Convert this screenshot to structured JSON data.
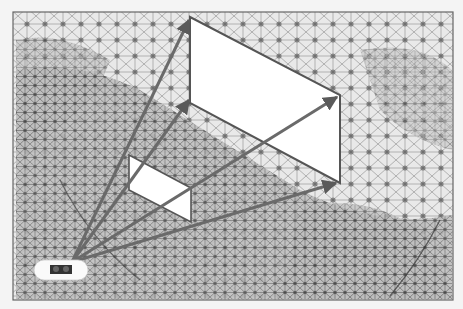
{
  "figure": {
    "colors": {
      "background": "#f4f4f4",
      "frame_border": "#666666",
      "mesh_line": "#8a8a8a",
      "mesh_dense": "#3a3a3a",
      "plane_fill": "#ffffff",
      "plane_edge": "#555555",
      "ray": "#6a6a6a",
      "camera_body": "#fafafa",
      "camera_lens": "#333333"
    },
    "frame": {
      "x": 13,
      "y": 12,
      "w": 440,
      "h": 288
    },
    "camera": {
      "x": 72,
      "y": 262,
      "label": "camera-icon"
    },
    "large_plane": {
      "points": [
        [
          190,
          17
        ],
        [
          340,
          95
        ],
        [
          340,
          183
        ],
        [
          190,
          103
        ]
      ]
    },
    "small_plane": {
      "points": [
        [
          129,
          155
        ],
        [
          191,
          188
        ],
        [
          191,
          222
        ],
        [
          129,
          190
        ]
      ]
    },
    "rays": [
      {
        "to": [
          190,
          17
        ]
      },
      {
        "to": [
          340,
          95
        ]
      },
      {
        "to": [
          340,
          183
        ]
      },
      {
        "to": [
          190,
          103
        ]
      }
    ]
  }
}
